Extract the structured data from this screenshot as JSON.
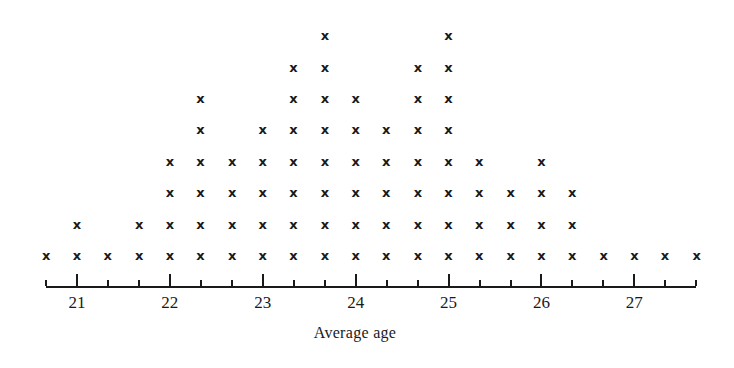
{
  "chart_data": {
    "type": "dot",
    "title": "",
    "xlabel": "Average age",
    "ylabel": "",
    "marker": "x",
    "xlim": [
      20.667,
      27.667
    ],
    "x_ticks_major": [
      21,
      22,
      23,
      24,
      25,
      26,
      27
    ],
    "x_tick_labels": [
      "21",
      "22",
      "23",
      "24",
      "25",
      "26",
      "27"
    ],
    "minor_tick_step": 0.3333,
    "grid": false,
    "x": [
      20.67,
      21.0,
      21.33,
      21.67,
      22.0,
      22.33,
      22.67,
      23.0,
      23.33,
      23.67,
      24.0,
      24.33,
      24.67,
      25.0,
      25.33,
      25.67,
      26.0,
      26.33,
      26.67,
      27.0,
      27.33,
      27.67
    ],
    "counts": [
      1,
      2,
      1,
      2,
      4,
      6,
      4,
      5,
      7,
      8,
      6,
      5,
      7,
      8,
      4,
      3,
      4,
      3,
      1,
      1,
      1,
      1
    ]
  },
  "layout": {
    "x0_px": 46,
    "px_per_unit": 92.9,
    "baseline_px": 256,
    "row_step_px": 31.4,
    "axis_y_px": 286
  },
  "mark_glyph": "x"
}
